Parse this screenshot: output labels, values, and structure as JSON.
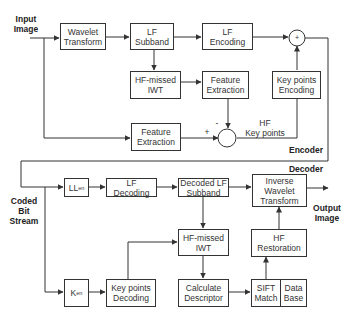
{
  "diagram": {
    "sections": {
      "encoder": "Encoder",
      "decoder": "Decoder"
    },
    "io_labels": {
      "input_image": "Input\nImage",
      "coded_bit_stream": "Coded\nBit\nStream",
      "output_image": "Output\nImage"
    },
    "encoder": {
      "wavelet_transform": "Wavelet\nTransform",
      "lf_subband": "LF\nSubband",
      "lf_encoding": "LF\nEncoding",
      "hf_missed_iwt": "HF-missed\nIWT",
      "feature_extraction_top": "Feature\nExtraction",
      "key_points_encoding": "Key points\nEncoding",
      "feature_extraction_bottom": "Feature\nExtraction",
      "sum_symbol": "+",
      "minus_sign": "-",
      "plus_sign": "+",
      "hf_key_points": "HF\nKey points"
    },
    "decoder": {
      "ll_en_main": "LL",
      "ll_en_sub": "en",
      "lf_decoding": "LF\nDecoding",
      "decoded_lf_subband": "Decoded LF\nSubband",
      "inverse_wavelet_transform": "Inverse\nWavelet\nTransform",
      "hf_missed_iwt": "HF-missed\nIWT",
      "hf_restoration": "HF\nRestoration",
      "k_en_main": "K",
      "k_en_sub": "en",
      "key_points_decoding": "Key points\nDecoding",
      "calculate_descriptor": "Calculate\nDescriptor",
      "sift_match": "SIFT\nMatch",
      "data_base": "Data\nBase"
    },
    "colors": {
      "line": "#333333",
      "background": "#ffffff"
    }
  }
}
